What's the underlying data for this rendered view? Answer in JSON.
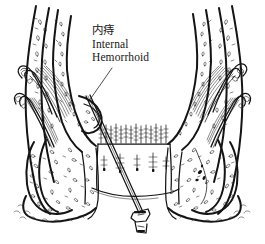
{
  "figure": {
    "background_color": "#ffffff",
    "ink_color": "#141414",
    "width": 265,
    "height": 244,
    "style": "pen-and-ink medical illustration"
  },
  "annotation": {
    "chinese_label": "内痔",
    "english_line1": "Internal",
    "english_line2": "Hemorrhoid",
    "leader_line": "diagonal line from label down-left to hemorrhoid bulge on left rectal wall"
  },
  "structures": [
    {
      "name": "left-rectal-wall",
      "description": "Left rectal wall in cross-section with mucosal stippling"
    },
    {
      "name": "right-rectal-wall",
      "description": "Right rectal wall in cross-section with mucosal stippling"
    },
    {
      "name": "left-muscle-fibers",
      "description": "Striated levator / sphincter muscle fibers, left side"
    },
    {
      "name": "right-muscle-fibers",
      "description": "Striated levator / sphincter muscle fibers, right side"
    },
    {
      "name": "hemorrhoid-bulge",
      "description": "Bulging internal hemorrhoid on left wall above dentate line"
    },
    {
      "name": "dentate-line-band",
      "description": "Comb-like band of anal columns at the dentate line"
    },
    {
      "name": "anal-canal-lumen",
      "description": "Open lumen of the anal canal below the dentate line"
    },
    {
      "name": "instrument-probe",
      "description": "Slender probe / needle instrument angled down to the right"
    },
    {
      "name": "instrument-tip",
      "description": "Flared tip of the probe at lower center"
    },
    {
      "name": "perianal-skin",
      "description": "Stippled perianal skin and subcutaneous tissue at base"
    }
  ]
}
